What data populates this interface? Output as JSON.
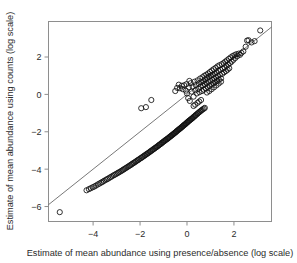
{
  "chart_data": {
    "type": "scatter",
    "title": "",
    "xlabel": "Estimate of mean abundance using presence/absence (log scale)",
    "ylabel": "Estimate of mean abundance using counts (log scale)",
    "xlim": [
      -5.9,
      3.6
    ],
    "ylim": [
      -6.8,
      3.9
    ],
    "xticks": [
      -4,
      -2,
      0,
      2
    ],
    "xtick_labels": [
      "-4",
      "-2",
      "0",
      "2"
    ],
    "yticks": [
      2,
      0,
      -2,
      -4,
      -6
    ],
    "ytick_labels": [
      "2",
      "0",
      "-2",
      "-4",
      "-6"
    ],
    "grid": false,
    "legend": null,
    "marker": "open-circle",
    "marker_size": 2.6,
    "annotations": [],
    "reference_line": {
      "name": "identity-line",
      "slope": 1.0,
      "intercept": 0.0,
      "x_start": -5.9,
      "x_end": 3.6,
      "style": "solid"
    },
    "points": [
      [
        -5.42,
        -6.3
      ],
      [
        -4.28,
        -5.13
      ],
      [
        -4.18,
        -5.07
      ],
      [
        -4.1,
        -5.02
      ],
      [
        -4.02,
        -4.97
      ],
      [
        -3.95,
        -4.93
      ],
      [
        -3.88,
        -4.88
      ],
      [
        -3.8,
        -4.82
      ],
      [
        -3.73,
        -4.77
      ],
      [
        -3.66,
        -4.72
      ],
      [
        -3.6,
        -4.68
      ],
      [
        -3.54,
        -4.63
      ],
      [
        -3.47,
        -4.58
      ],
      [
        -3.41,
        -4.54
      ],
      [
        -3.35,
        -4.5
      ],
      [
        -3.29,
        -4.45
      ],
      [
        -3.23,
        -4.41
      ],
      [
        -3.17,
        -4.36
      ],
      [
        -3.11,
        -4.32
      ],
      [
        -3.05,
        -4.28
      ],
      [
        -3.0,
        -4.24
      ],
      [
        -2.94,
        -4.2
      ],
      [
        -2.89,
        -4.16
      ],
      [
        -2.83,
        -4.12
      ],
      [
        -2.78,
        -4.08
      ],
      [
        -2.73,
        -4.04
      ],
      [
        -2.68,
        -4.0
      ],
      [
        -2.63,
        -3.96
      ],
      [
        -2.58,
        -3.92
      ],
      [
        -2.53,
        -3.88
      ],
      [
        -2.48,
        -3.84
      ],
      [
        -2.43,
        -3.8
      ],
      [
        -2.38,
        -3.76
      ],
      [
        -2.34,
        -3.72
      ],
      [
        -2.29,
        -3.68
      ],
      [
        -2.25,
        -3.65
      ],
      [
        -2.2,
        -3.61
      ],
      [
        -2.16,
        -3.57
      ],
      [
        -2.11,
        -3.53
      ],
      [
        -2.07,
        -3.5
      ],
      [
        -2.03,
        -3.46
      ],
      [
        -1.98,
        -3.42
      ],
      [
        -1.94,
        -3.39
      ],
      [
        -1.9,
        -3.35
      ],
      [
        -1.86,
        -3.32
      ],
      [
        -1.82,
        -3.28
      ],
      [
        -1.78,
        -3.25
      ],
      [
        -1.74,
        -3.21
      ],
      [
        -1.7,
        -3.18
      ],
      [
        -1.66,
        -3.14
      ],
      [
        -1.62,
        -3.11
      ],
      [
        -1.58,
        -3.07
      ],
      [
        -1.55,
        -3.04
      ],
      [
        -1.51,
        -3.01
      ],
      [
        -1.47,
        -2.97
      ],
      [
        -1.44,
        -2.94
      ],
      [
        -1.4,
        -2.91
      ],
      [
        -1.36,
        -2.87
      ],
      [
        -1.33,
        -2.84
      ],
      [
        -1.29,
        -2.81
      ],
      [
        -1.26,
        -2.78
      ],
      [
        -1.22,
        -2.74
      ],
      [
        -1.19,
        -2.71
      ],
      [
        -1.16,
        -2.68
      ],
      [
        -1.12,
        -2.65
      ],
      [
        -1.09,
        -2.62
      ],
      [
        -1.06,
        -2.58
      ],
      [
        -1.02,
        -2.55
      ],
      [
        -0.99,
        -2.52
      ],
      [
        -0.96,
        -2.49
      ],
      [
        -0.93,
        -2.46
      ],
      [
        -0.9,
        -2.43
      ],
      [
        -0.86,
        -2.4
      ],
      [
        -0.83,
        -2.37
      ],
      [
        -0.8,
        -2.34
      ],
      [
        -0.77,
        -2.31
      ],
      [
        -0.74,
        -2.28
      ],
      [
        -0.71,
        -2.25
      ],
      [
        -0.68,
        -2.22
      ],
      [
        -0.65,
        -2.19
      ],
      [
        -0.62,
        -2.16
      ],
      [
        -0.59,
        -2.13
      ],
      [
        -0.56,
        -2.1
      ],
      [
        -0.53,
        -2.07
      ],
      [
        -0.5,
        -2.04
      ],
      [
        -0.47,
        -2.01
      ],
      [
        -0.45,
        -1.98
      ],
      [
        -0.42,
        -1.95
      ],
      [
        -0.39,
        -1.92
      ],
      [
        -0.36,
        -1.89
      ],
      [
        -0.33,
        -1.86
      ],
      [
        -0.31,
        -1.84
      ],
      [
        -0.28,
        -1.81
      ],
      [
        -0.25,
        -1.78
      ],
      [
        -0.22,
        -1.75
      ],
      [
        -0.2,
        -1.72
      ],
      [
        -0.17,
        -1.69
      ],
      [
        -0.14,
        -1.66
      ],
      [
        -0.12,
        -1.63
      ],
      [
        -0.09,
        -1.61
      ],
      [
        -0.06,
        -1.58
      ],
      [
        -0.04,
        -1.55
      ],
      [
        -0.01,
        -1.52
      ],
      [
        0.02,
        -1.49
      ],
      [
        0.04,
        -1.46
      ],
      [
        0.07,
        -1.43
      ],
      [
        0.1,
        -1.4
      ],
      [
        0.13,
        -1.37
      ],
      [
        0.16,
        -1.34
      ],
      [
        0.19,
        -1.31
      ],
      [
        0.22,
        -1.28
      ],
      [
        0.25,
        -1.25
      ],
      [
        0.28,
        -1.21
      ],
      [
        0.31,
        -1.18
      ],
      [
        0.34,
        -1.15
      ],
      [
        0.37,
        -1.11
      ],
      [
        0.4,
        -1.08
      ],
      [
        0.44,
        -1.04
      ],
      [
        0.47,
        -1.0
      ],
      [
        0.51,
        -0.96
      ],
      [
        0.55,
        -0.92
      ],
      [
        0.59,
        -0.88
      ],
      [
        0.63,
        -0.84
      ],
      [
        0.67,
        -0.8
      ],
      [
        0.72,
        -0.76
      ],
      [
        0.76,
        -0.72
      ],
      [
        -1.95,
        -0.74
      ],
      [
        -1.75,
        -0.68
      ],
      [
        -1.52,
        -0.3
      ],
      [
        -0.35,
        0.52
      ],
      [
        -0.3,
        0.33
      ],
      [
        -0.22,
        0.46
      ],
      [
        -0.18,
        0.28
      ],
      [
        -0.12,
        0.49
      ],
      [
        -0.05,
        0.2
      ],
      [
        -0.02,
        0.55
      ],
      [
        0.05,
        -0.2
      ],
      [
        0.08,
        0.38
      ],
      [
        0.12,
        -0.35
      ],
      [
        0.16,
        0.6
      ],
      [
        0.2,
        0.15
      ],
      [
        0.24,
        0.42
      ],
      [
        0.28,
        -0.12
      ],
      [
        0.32,
        0.68
      ],
      [
        0.35,
        0.22
      ],
      [
        0.38,
        0.5
      ],
      [
        0.42,
        0.05
      ],
      [
        0.45,
        0.75
      ],
      [
        0.48,
        0.3
      ],
      [
        0.5,
        0.58
      ],
      [
        0.53,
        0.12
      ],
      [
        0.56,
        0.85
      ],
      [
        0.58,
        0.4
      ],
      [
        0.61,
        0.65
      ],
      [
        0.64,
        0.18
      ],
      [
        0.66,
        0.92
      ],
      [
        0.68,
        0.48
      ],
      [
        0.7,
        0.72
      ],
      [
        0.72,
        0.25
      ],
      [
        0.74,
        1.0
      ],
      [
        0.76,
        0.55
      ],
      [
        0.78,
        0.8
      ],
      [
        0.8,
        0.32
      ],
      [
        0.82,
        1.05
      ],
      [
        0.84,
        0.6
      ],
      [
        0.86,
        0.88
      ],
      [
        0.88,
        0.4
      ],
      [
        0.9,
        1.12
      ],
      [
        0.92,
        0.68
      ],
      [
        0.94,
        0.95
      ],
      [
        0.96,
        0.45
      ],
      [
        0.98,
        1.2
      ],
      [
        1.0,
        0.72
      ],
      [
        1.02,
        1.0
      ],
      [
        1.04,
        0.52
      ],
      [
        1.06,
        1.28
      ],
      [
        1.08,
        0.78
      ],
      [
        1.1,
        1.05
      ],
      [
        1.12,
        0.6
      ],
      [
        1.14,
        1.35
      ],
      [
        1.16,
        0.85
      ],
      [
        1.18,
        1.12
      ],
      [
        1.2,
        0.65
      ],
      [
        1.22,
        1.42
      ],
      [
        1.24,
        0.92
      ],
      [
        1.26,
        1.18
      ],
      [
        1.28,
        0.72
      ],
      [
        1.3,
        1.5
      ],
      [
        1.32,
        0.98
      ],
      [
        1.34,
        1.25
      ],
      [
        1.36,
        0.78
      ],
      [
        1.38,
        1.56
      ],
      [
        1.4,
        1.05
      ],
      [
        1.42,
        1.32
      ],
      [
        1.45,
        0.85
      ],
      [
        1.48,
        1.62
      ],
      [
        1.5,
        1.1
      ],
      [
        1.53,
        1.38
      ],
      [
        1.56,
        1.68
      ],
      [
        1.58,
        1.18
      ],
      [
        1.6,
        1.45
      ],
      [
        1.63,
        1.75
      ],
      [
        1.66,
        1.25
      ],
      [
        1.68,
        1.52
      ],
      [
        1.7,
        1.82
      ],
      [
        1.73,
        1.32
      ],
      [
        1.76,
        1.6
      ],
      [
        1.78,
        1.9
      ],
      [
        1.8,
        1.4
      ],
      [
        1.83,
        1.68
      ],
      [
        1.86,
        1.98
      ],
      [
        1.9,
        1.75
      ],
      [
        1.94,
        2.05
      ],
      [
        1.98,
        1.85
      ],
      [
        2.02,
        2.1
      ],
      [
        2.06,
        1.95
      ],
      [
        2.1,
        2.15
      ],
      [
        2.15,
        2.05
      ],
      [
        2.2,
        2.18
      ],
      [
        2.26,
        2.12
      ],
      [
        2.32,
        2.22
      ],
      [
        2.4,
        2.3
      ],
      [
        2.5,
        2.55
      ],
      [
        2.56,
        2.88
      ],
      [
        2.62,
        2.9
      ],
      [
        2.75,
        2.78
      ],
      [
        2.88,
        2.85
      ],
      [
        3.12,
        3.42
      ],
      [
        0.45,
        -0.45
      ],
      [
        0.52,
        -0.38
      ],
      [
        0.6,
        -0.3
      ],
      [
        0.35,
        -0.55
      ],
      [
        0.28,
        -0.62
      ],
      [
        0.85,
        0.1
      ],
      [
        0.95,
        0.18
      ],
      [
        1.05,
        0.28
      ],
      [
        1.15,
        0.38
      ],
      [
        1.25,
        0.48
      ],
      [
        1.35,
        0.58
      ],
      [
        1.45,
        0.68
      ],
      [
        -0.42,
        0.35
      ],
      [
        -0.5,
        0.18
      ],
      [
        0.0,
        0.05
      ],
      [
        0.1,
        0.72
      ]
    ]
  }
}
